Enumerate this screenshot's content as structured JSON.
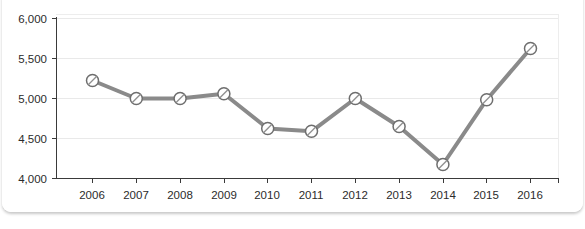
{
  "chart_data": {
    "type": "line",
    "title": "",
    "subtitle": "",
    "xlabel": "",
    "ylabel": "",
    "categories": [
      "2006",
      "2007",
      "2008",
      "2009",
      "2010",
      "2011",
      "2012",
      "2013",
      "2014",
      "2015",
      "2016"
    ],
    "values": [
      5225,
      5000,
      5000,
      5060,
      4625,
      4590,
      5000,
      4650,
      4175,
      4985,
      5625
    ],
    "series": [
      {
        "name": "Series 1",
        "values": [
          5225,
          5000,
          5000,
          5060,
          4625,
          4590,
          5000,
          4650,
          4175,
          4985,
          5625
        ]
      }
    ],
    "ylim": [
      4000,
      6000
    ],
    "ytick_values": [
      4000,
      4500,
      5000,
      5500,
      6000
    ],
    "ytick_labels": [
      "4,000",
      "4,500",
      "5,000",
      "5,500",
      "6,000"
    ],
    "xtick_labels": [
      "2006",
      "2007",
      "2008",
      "2009",
      "2010",
      "2011",
      "2012",
      "2013",
      "2014",
      "2015",
      "2016"
    ],
    "grid": true,
    "grid_axis": "y",
    "legend": false,
    "legend_position": "none",
    "annotations": [],
    "colors": {
      "line": "#8a8a8a",
      "marker_fill": "#ffffff",
      "marker_stroke": "#6e6e6e",
      "gridline": "#e9e9e9",
      "axis": "#3a3a3a",
      "tick_text": "#2b2b2b",
      "card_background": "#ffffff",
      "page_background": "#ffffff"
    },
    "marker_style": "circle-with-diagonal-slash"
  }
}
